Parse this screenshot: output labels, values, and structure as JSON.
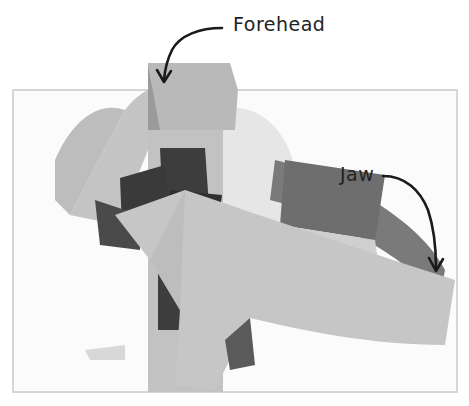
{
  "figure": {
    "annotations": [
      {
        "id": "forehead",
        "label": "Forehead"
      },
      {
        "id": "jaw",
        "label": "Jaw"
      }
    ]
  },
  "colors": {
    "frame": "#d6d6d6",
    "cardboard_light": "#c9c9c9",
    "cardboard_mid": "#a9a9a9",
    "cardboard_dark": "#6e6e6e",
    "tape": "#3a3a3a",
    "ball": "#e4e4e4",
    "ink": "#1a1a1a"
  }
}
